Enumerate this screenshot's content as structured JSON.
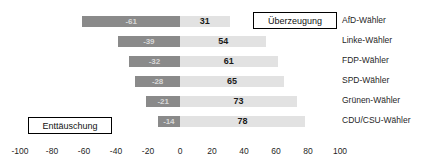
{
  "chart_data": {
    "type": "bar",
    "orientation": "horizontal",
    "subtype": "diverging",
    "title": "",
    "xlabel": "",
    "ylabel": "",
    "xlim": [
      -100,
      100
    ],
    "xticks": [
      -100,
      -80,
      -60,
      -40,
      -20,
      0,
      20,
      40,
      60,
      80,
      100
    ],
    "xtick_labels": [
      "-100",
      "-80",
      "-60",
      "-40",
      "-20",
      "0",
      "20",
      "40",
      "60",
      "80",
      "100"
    ],
    "grid": false,
    "legend": "none",
    "categories": [
      "AfD-Wähler",
      "Linke-Wähler",
      "FDP-Wähler",
      "SPD-Wähler",
      "Grünen-Wähler",
      "CDU/CSU-Wähler"
    ],
    "series": [
      {
        "name": "Enttäuschung",
        "color": "#8a8a8a",
        "values": [
          -61,
          -39,
          -32,
          -28,
          -21,
          -14
        ],
        "labels": [
          "-61",
          "-39",
          "-32",
          "-28",
          "-21",
          "-14"
        ]
      },
      {
        "name": "Überzeugung",
        "color": "#e2e2e2",
        "values": [
          31,
          54,
          61,
          65,
          73,
          78
        ],
        "labels": [
          "31",
          "54",
          "61",
          "65",
          "73",
          "78"
        ]
      }
    ],
    "annotations": [
      {
        "text": "Überzeugung",
        "x_px": 253,
        "y_px": 12,
        "width_px": 84
      },
      {
        "text": "Enttäuschung",
        "x_px": 28,
        "y_px": 117,
        "width_px": 84
      }
    ]
  },
  "axis": {
    "zero_px": 180,
    "scale_px_per_unit": 1.6,
    "row_height_px": 20,
    "first_row_top_px": 12
  }
}
